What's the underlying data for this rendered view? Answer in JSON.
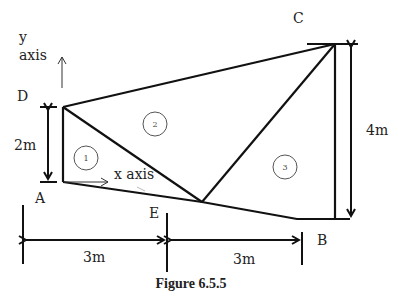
{
  "figure": {
    "caption": "Figure 6.5.5",
    "points": {
      "A": {
        "label": "A"
      },
      "B": {
        "label": "B"
      },
      "C": {
        "label": "C"
      },
      "D": {
        "label": "D"
      },
      "E": {
        "label": "E"
      }
    },
    "regions": [
      {
        "id": "1",
        "label": "1"
      },
      {
        "id": "2",
        "label": "2"
      },
      {
        "id": "3",
        "label": "3"
      }
    ],
    "axes": {
      "y_label_line1": "y",
      "y_label_line2": "axis",
      "x_label": "x axis"
    },
    "dimensions": {
      "AD_height": "2m",
      "CB_height": "4m",
      "AE_width": "3m",
      "EB_width": "3m"
    },
    "colors": {
      "line": "#111111",
      "text": "#222222",
      "circle": "#555555"
    }
  }
}
